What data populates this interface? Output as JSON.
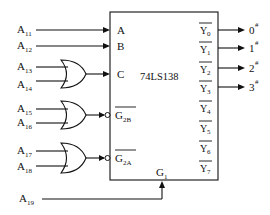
{
  "diagram": {
    "chip": {
      "name": "74LS138"
    },
    "inputs": {
      "A": {
        "label": "A",
        "source": "A",
        "sub": "11"
      },
      "B": {
        "label": "B",
        "source": "A",
        "sub": "12"
      },
      "C": {
        "label": "C",
        "sources": [
          {
            "name": "A",
            "sub": "13"
          },
          {
            "name": "A",
            "sub": "14"
          }
        ],
        "gate": "OR"
      },
      "G2B": {
        "label": "G",
        "sub": "2B",
        "overbar": true,
        "sources": [
          {
            "name": "A",
            "sub": "15"
          },
          {
            "name": "A",
            "sub": "16"
          }
        ],
        "gate": "OR"
      },
      "G2A": {
        "label": "G",
        "sub": "2A",
        "overbar": true,
        "sources": [
          {
            "name": "A",
            "sub": "17"
          },
          {
            "name": "A",
            "sub": "18"
          }
        ],
        "gate": "OR"
      },
      "G1": {
        "label": "G",
        "sub": "1",
        "source": "A",
        "source_sub": "19"
      }
    },
    "outputs": [
      {
        "label": "Y",
        "sub": "0",
        "target": "0",
        "target_sup": "#"
      },
      {
        "label": "Y",
        "sub": "1",
        "target": "1",
        "target_sup": "#"
      },
      {
        "label": "Y",
        "sub": "2",
        "target": "2",
        "target_sup": "#"
      },
      {
        "label": "Y",
        "sub": "3",
        "target": "3",
        "target_sup": "#"
      },
      {
        "label": "Y",
        "sub": "4"
      },
      {
        "label": "Y",
        "sub": "5"
      },
      {
        "label": "Y",
        "sub": "6"
      },
      {
        "label": "Y",
        "sub": "7"
      }
    ]
  }
}
